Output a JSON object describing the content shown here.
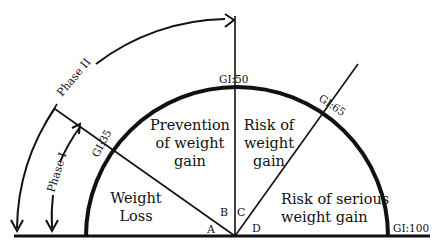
{
  "diagram": {
    "type": "glycemic-index semicircle",
    "colors": {
      "stroke": "#111111",
      "background": "#ffffff"
    },
    "gi_markers": {
      "gi35": "GI:35",
      "gi50": "GI:50",
      "gi65": "GI:65",
      "gi100": "GI:100"
    },
    "phases": {
      "phase1": "Phase I",
      "phase2": "Phase II"
    },
    "regions": {
      "weight_loss": [
        "Weight",
        "Loss"
      ],
      "prevention": [
        "Prevention",
        "of weight",
        "gain"
      ],
      "risk": [
        "Risk of",
        "weight",
        "gain"
      ],
      "serious_risk": [
        "Risk of serious",
        "weight gain"
      ]
    },
    "angle_labels": {
      "a": "A",
      "b": "B",
      "c": "C",
      "d": "D"
    }
  }
}
